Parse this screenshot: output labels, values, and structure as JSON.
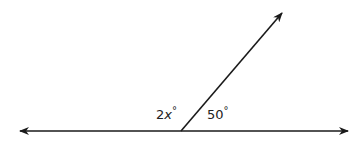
{
  "diagram": {
    "type": "angle-diagram",
    "stroke_color": "#1a1a1a",
    "line": {
      "left_arrow": {
        "x": 20,
        "y": 131
      },
      "right_arrow": {
        "x": 348,
        "y": 131
      },
      "vertex": {
        "x": 181,
        "y": 131
      }
    },
    "ray": {
      "from": {
        "x": 181,
        "y": 131
      },
      "to": {
        "x": 282,
        "y": 13
      }
    },
    "angles": [
      {
        "position": "left",
        "coefficient": "2",
        "variable": "x",
        "degree_symbol": "°"
      },
      {
        "position": "right",
        "value": "50",
        "degree_symbol": "°"
      }
    ]
  }
}
